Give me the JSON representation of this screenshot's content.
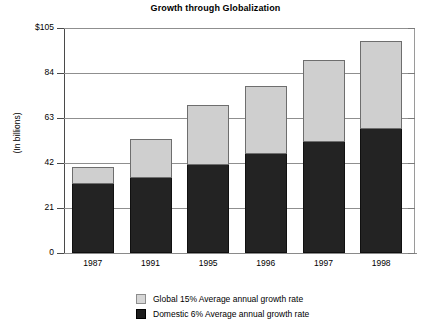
{
  "chart_data": {
    "type": "bar",
    "subtype": "stacked-bar",
    "title": "Growth through Globalization",
    "xlabel": "",
    "ylabel": "(In billions)",
    "categories": [
      "1987",
      "1991",
      "1995",
      "1996",
      "1997",
      "1998"
    ],
    "series": [
      {
        "name": "Domestic 6% Average annual growth rate",
        "color": "#232323",
        "values": [
          32,
          35,
          41,
          46,
          52,
          58
        ]
      },
      {
        "name": "Global 15% Average annual growth rate",
        "color": "#cfcfcf",
        "values": [
          8,
          18,
          28,
          32,
          38,
          41
        ]
      }
    ],
    "totals": [
      40,
      53,
      69,
      78,
      90,
      99
    ],
    "ylim": [
      0,
      105
    ],
    "yticks": [
      0,
      21,
      42,
      63,
      84,
      105
    ],
    "ytick_labels": [
      "0",
      "21",
      "42",
      "63",
      "84",
      "$105"
    ],
    "grid": true,
    "legend_position": "bottom"
  },
  "legend": {
    "items": [
      {
        "label": "Global 15% Average annual growth rate",
        "swatch": "global"
      },
      {
        "label": "Domestic 6% Average annual growth rate",
        "swatch": "domestic"
      }
    ]
  }
}
